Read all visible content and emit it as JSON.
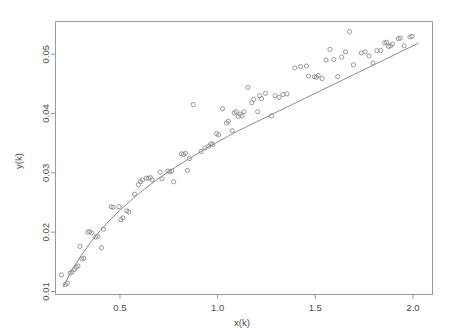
{
  "chart_data": {
    "type": "scatter",
    "title": "",
    "subtitle": "",
    "xlabel": "x(k)",
    "ylabel": "y(k)",
    "xlim": [
      0.17,
      2.1
    ],
    "ylim": [
      0.0095,
      0.0555
    ],
    "xticks": [
      0.5,
      1.0,
      1.5,
      2.0
    ],
    "xtick_labels": [
      "0.5",
      "1.0",
      "1.5",
      "2.0"
    ],
    "yticks": [
      0.01,
      0.02,
      0.03,
      0.04,
      0.05
    ],
    "ytick_labels": [
      "0.01",
      "0.02",
      "0.03",
      "0.04",
      "0.05"
    ],
    "grid": false,
    "legend": null,
    "marker": "open-circle",
    "marker_color": "#8a8a8a",
    "line_color": "#8d8d8d",
    "frame_color": "#9a9a9a",
    "background": "#ffffff",
    "annotations": [],
    "series": [
      {
        "name": "observations",
        "type": "scatter",
        "points": [
          [
            0.2,
            0.0128
          ],
          [
            0.22,
            0.0112
          ],
          [
            0.23,
            0.0114
          ],
          [
            0.245,
            0.0131
          ],
          [
            0.255,
            0.0133
          ],
          [
            0.265,
            0.0137
          ],
          [
            0.275,
            0.0141
          ],
          [
            0.285,
            0.0143
          ],
          [
            0.295,
            0.0176
          ],
          [
            0.305,
            0.0155
          ],
          [
            0.315,
            0.0156
          ],
          [
            0.335,
            0.02
          ],
          [
            0.345,
            0.0201
          ],
          [
            0.355,
            0.0199
          ],
          [
            0.375,
            0.0192
          ],
          [
            0.385,
            0.0193
          ],
          [
            0.405,
            0.0174
          ],
          [
            0.415,
            0.0205
          ],
          [
            0.455,
            0.0243
          ],
          [
            0.465,
            0.0242
          ],
          [
            0.495,
            0.0243
          ],
          [
            0.505,
            0.0221
          ],
          [
            0.515,
            0.0224
          ],
          [
            0.535,
            0.0236
          ],
          [
            0.545,
            0.0234
          ],
          [
            0.575,
            0.0264
          ],
          [
            0.595,
            0.028
          ],
          [
            0.605,
            0.0285
          ],
          [
            0.615,
            0.0288
          ],
          [
            0.635,
            0.0291
          ],
          [
            0.645,
            0.0291
          ],
          [
            0.655,
            0.0292
          ],
          [
            0.665,
            0.0288
          ],
          [
            0.705,
            0.0301
          ],
          [
            0.715,
            0.029
          ],
          [
            0.745,
            0.0303
          ],
          [
            0.755,
            0.0302
          ],
          [
            0.765,
            0.0303
          ],
          [
            0.775,
            0.0285
          ],
          [
            0.815,
            0.0332
          ],
          [
            0.825,
            0.0331
          ],
          [
            0.835,
            0.0333
          ],
          [
            0.845,
            0.0304
          ],
          [
            0.855,
            0.0324
          ],
          [
            0.875,
            0.0415
          ],
          [
            0.915,
            0.0336
          ],
          [
            0.935,
            0.0342
          ],
          [
            0.955,
            0.0345
          ],
          [
            0.965,
            0.0349
          ],
          [
            0.975,
            0.0348
          ],
          [
            0.995,
            0.0366
          ],
          [
            1.005,
            0.0364
          ],
          [
            1.025,
            0.0408
          ],
          [
            1.045,
            0.0384
          ],
          [
            1.055,
            0.0387
          ],
          [
            1.075,
            0.0371
          ],
          [
            1.085,
            0.0401
          ],
          [
            1.095,
            0.0403
          ],
          [
            1.105,
            0.0395
          ],
          [
            1.115,
            0.0399
          ],
          [
            1.125,
            0.0396
          ],
          [
            1.135,
            0.0403
          ],
          [
            1.155,
            0.0444
          ],
          [
            1.175,
            0.0418
          ],
          [
            1.185,
            0.0424
          ],
          [
            1.205,
            0.0403
          ],
          [
            1.215,
            0.043
          ],
          [
            1.225,
            0.0425
          ],
          [
            1.245,
            0.0434
          ],
          [
            1.275,
            0.0396
          ],
          [
            1.295,
            0.043
          ],
          [
            1.315,
            0.0427
          ],
          [
            1.335,
            0.0432
          ],
          [
            1.355,
            0.0433
          ],
          [
            1.395,
            0.0477
          ],
          [
            1.425,
            0.0479
          ],
          [
            1.455,
            0.048
          ],
          [
            1.465,
            0.0463
          ],
          [
            1.495,
            0.0462
          ],
          [
            1.505,
            0.0461
          ],
          [
            1.515,
            0.0464
          ],
          [
            1.535,
            0.0459
          ],
          [
            1.555,
            0.049
          ],
          [
            1.575,
            0.0508
          ],
          [
            1.595,
            0.0491
          ],
          [
            1.615,
            0.0462
          ],
          [
            1.635,
            0.0495
          ],
          [
            1.655,
            0.0504
          ],
          [
            1.675,
            0.0538
          ],
          [
            1.695,
            0.0482
          ],
          [
            1.735,
            0.0502
          ],
          [
            1.755,
            0.0504
          ],
          [
            1.775,
            0.0497
          ],
          [
            1.795,
            0.0485
          ],
          [
            1.815,
            0.0506
          ],
          [
            1.835,
            0.0506
          ],
          [
            1.855,
            0.0519
          ],
          [
            1.865,
            0.052
          ],
          [
            1.875,
            0.0513
          ],
          [
            1.885,
            0.0514
          ],
          [
            1.895,
            0.0517
          ],
          [
            1.925,
            0.0526
          ],
          [
            1.935,
            0.0527
          ],
          [
            1.955,
            0.0514
          ],
          [
            1.985,
            0.0529
          ],
          [
            1.995,
            0.053
          ]
        ]
      },
      {
        "name": "fitted-curve",
        "type": "line",
        "points": [
          [
            0.21,
            0.0108
          ],
          [
            0.25,
            0.0134
          ],
          [
            0.3,
            0.016
          ],
          [
            0.35,
            0.0183
          ],
          [
            0.4,
            0.0203
          ],
          [
            0.45,
            0.0221
          ],
          [
            0.5,
            0.0237
          ],
          [
            0.55,
            0.0252
          ],
          [
            0.6,
            0.0266
          ],
          [
            0.65,
            0.0279
          ],
          [
            0.7,
            0.0291
          ],
          [
            0.75,
            0.0302
          ],
          [
            0.8,
            0.0313
          ],
          [
            0.85,
            0.0323
          ],
          [
            0.9,
            0.0333
          ],
          [
            0.95,
            0.0343
          ],
          [
            1.0,
            0.0352
          ],
          [
            1.05,
            0.0361
          ],
          [
            1.1,
            0.037
          ],
          [
            1.15,
            0.0378
          ],
          [
            1.2,
            0.0386
          ],
          [
            1.25,
            0.0394
          ],
          [
            1.3,
            0.0402
          ],
          [
            1.35,
            0.041
          ],
          [
            1.4,
            0.0418
          ],
          [
            1.45,
            0.0426
          ],
          [
            1.5,
            0.0434
          ],
          [
            1.55,
            0.0442
          ],
          [
            1.6,
            0.045
          ],
          [
            1.65,
            0.0458
          ],
          [
            1.7,
            0.0466
          ],
          [
            1.75,
            0.0474
          ],
          [
            1.8,
            0.0482
          ],
          [
            1.85,
            0.049
          ],
          [
            1.9,
            0.0498
          ],
          [
            1.95,
            0.0506
          ],
          [
            2.0,
            0.0514
          ],
          [
            2.03,
            0.0519
          ]
        ]
      }
    ]
  }
}
